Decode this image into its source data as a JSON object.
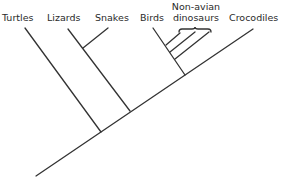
{
  "taxa": [
    {
      "id": "turtles",
      "label": "Turtles"
    },
    {
      "id": "lizards",
      "label": "Lizards"
    },
    {
      "id": "snakes",
      "label": "Snakes"
    },
    {
      "id": "birds",
      "label": "Birds"
    },
    {
      "id": "non-avian-dinosaurs",
      "label_line1": "Non-avian",
      "label_line2": "dinosaurs"
    },
    {
      "id": "crocodiles",
      "label": "Crocodiles"
    }
  ],
  "topology": "(Turtles,((Lizards,Snakes),((Birds,(dino,dino,dino)),Crocodiles)))",
  "line_color": "#333333"
}
